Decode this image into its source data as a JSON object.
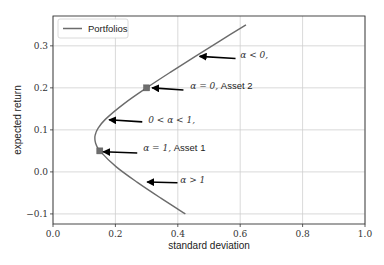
{
  "chart_data": {
    "type": "line",
    "title": "",
    "xlabel": "standard deviation",
    "ylabel": "expected return",
    "xlim": [
      0.0,
      1.0
    ],
    "ylim": [
      -0.124,
      0.371
    ],
    "xticks": [
      0.0,
      0.2,
      0.4,
      0.6,
      0.8,
      1.0
    ],
    "xtick_labels": [
      "0.0",
      "0.2",
      "0.4",
      "0.6",
      "0.8",
      "1.0"
    ],
    "yticks": [
      -0.1,
      0.0,
      0.1,
      0.2,
      0.3
    ],
    "ytick_labels": [
      "−0.1",
      "0.0",
      "0.1",
      "0.2",
      "0.3"
    ],
    "grid": true,
    "legend": {
      "placement": "top-left",
      "entries": [
        "Portfolios"
      ]
    },
    "colors": {
      "curve": "#6b6b6b",
      "marker": "#6e6e6e",
      "grid": "#cfcfcf",
      "arrow": "#000000",
      "frame": "#333333"
    },
    "series": [
      {
        "name": "Portfolios",
        "alpha": [
          -1.0,
          -0.75,
          -0.5,
          -0.25,
          0.0,
          0.25,
          0.5,
          0.65,
          0.75,
          0.8,
          0.85,
          0.9,
          1.0,
          1.25,
          1.5,
          1.75,
          2.0
        ],
        "x": [
          0.6185,
          0.5369,
          0.4562,
          0.3769,
          0.3,
          0.2281,
          0.1677,
          0.1433,
          0.1352,
          0.1342,
          0.1352,
          0.1383,
          0.15,
          0.2019,
          0.2704,
          0.3457,
          0.4243
        ],
        "y": [
          0.35,
          0.3125,
          0.275,
          0.2375,
          0.2,
          0.1625,
          0.125,
          0.1025,
          0.0875,
          0.08,
          0.0725,
          0.065,
          0.05,
          0.0125,
          -0.025,
          -0.0625,
          -0.1
        ]
      }
    ],
    "points": [
      {
        "name": "Asset 2",
        "x": 0.3,
        "y": 0.2
      },
      {
        "name": "Asset 1",
        "x": 0.15,
        "y": 0.05
      }
    ],
    "annotations": [
      {
        "math": "α < 0,",
        "label": "",
        "head": [
          0.47,
          0.275
        ],
        "tail": [
          0.585,
          0.27
        ],
        "text": [
          0.6,
          0.279
        ]
      },
      {
        "math": "α = 0,",
        "label": " Asset 2",
        "head": [
          0.318,
          0.2
        ],
        "tail": [
          0.418,
          0.195
        ],
        "text": [
          0.44,
          0.205
        ]
      },
      {
        "math": "0 < α < 1,",
        "label": "",
        "head": [
          0.18,
          0.124
        ],
        "tail": [
          0.286,
          0.119
        ],
        "text": [
          0.305,
          0.124
        ]
      },
      {
        "math": "α = 1,",
        "label": " Asset 1",
        "head": [
          0.161,
          0.048
        ],
        "tail": [
          0.27,
          0.045
        ],
        "text": [
          0.289,
          0.057
        ]
      },
      {
        "math": "α > 1",
        "label": "",
        "head": [
          0.302,
          -0.024
        ],
        "tail": [
          0.399,
          -0.026
        ],
        "text": [
          0.408,
          -0.019
        ]
      }
    ]
  }
}
